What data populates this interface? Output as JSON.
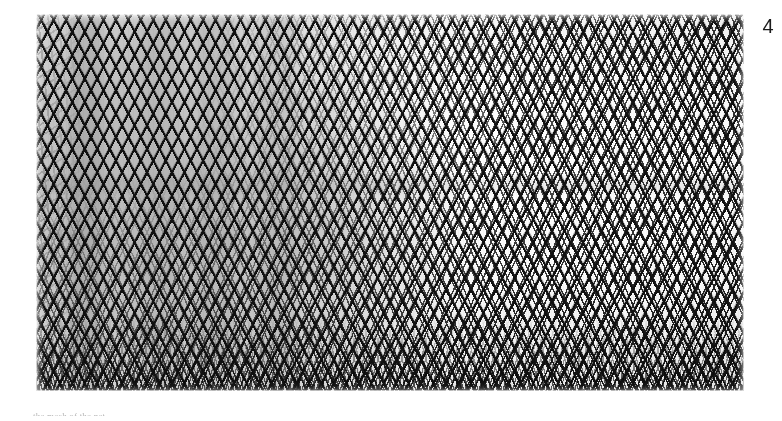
{
  "page": {
    "background_color": "#ffffff",
    "width": 782,
    "height": 421
  },
  "figure": {
    "number_label": "4",
    "caption_fragment": "the mesh of the net",
    "photo": {
      "subject": "netting-mesh-closeup",
      "description": "Black and white close-up photograph of diamond-shaped netting mesh viewed in perspective",
      "tones": {
        "mesh_twine": "#111111",
        "open_mesh_light": "#f5f5f5",
        "open_mesh_grey": "#9a9a9a",
        "dense_bottom_edge": "#0b0b0b",
        "scan_paper": "#ffffff"
      }
    }
  }
}
